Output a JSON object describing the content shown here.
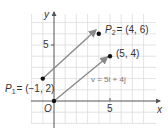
{
  "diagram": {
    "type": "coordinate-plane-vectors",
    "grid": {
      "x_min": -2,
      "x_max": 8,
      "y_min": -2,
      "y_max": 7,
      "unit_px": 11.2,
      "origin_px": [
        54,
        101
      ],
      "color": "#d9d9d9"
    },
    "axes": {
      "x_label": "x",
      "y_label": "y",
      "origin_label": "O",
      "x_tick_label": "5",
      "y_tick_label": "5"
    },
    "points": [
      {
        "id": "p1",
        "x": -1,
        "y": 2,
        "label": "P₁ = (−1, 2)",
        "name": "P",
        "sub": "1",
        "coords": "= (−1, 2)"
      },
      {
        "id": "p2",
        "x": 4,
        "y": 6,
        "label": "P₂ = (4, 6)",
        "name": "P",
        "sub": "2",
        "coords": "= (4, 6)"
      },
      {
        "id": "origin",
        "x": 0,
        "y": 0,
        "label": "O"
      },
      {
        "id": "tip",
        "x": 5,
        "y": 4,
        "label": "(5, 4)"
      }
    ],
    "vectors": [
      {
        "from": [
          -1,
          2
        ],
        "to": [
          4,
          6
        ]
      },
      {
        "from": [
          0,
          0
        ],
        "to": [
          5,
          4
        ],
        "label": "v = 5i + 4j"
      }
    ],
    "colors": {
      "arrow": "#8a8a8a",
      "point": "#111111",
      "axis": "#555555",
      "text": "#333333",
      "vector_label": "#777777"
    }
  }
}
